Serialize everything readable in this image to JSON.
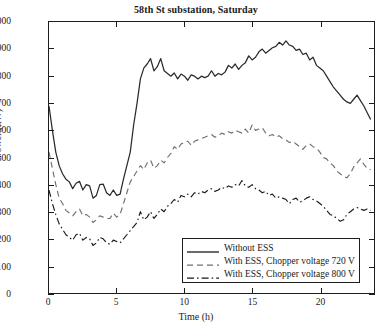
{
  "chart_data": {
    "type": "line",
    "title": "58th St substation, Saturday",
    "xlabel": "Time (h)",
    "ylabel": "Power (kW)",
    "xlim": [
      0,
      24
    ],
    "ylim": [
      0,
      1000
    ],
    "xticks": [
      0,
      5,
      10,
      15,
      20
    ],
    "ytick_labels": [
      "0",
      "100",
      "200",
      "300",
      "400",
      "500",
      "600",
      "700",
      "800",
      "900",
      "1000"
    ],
    "yticks": [
      0,
      100,
      200,
      300,
      400,
      500,
      600,
      700,
      800,
      900,
      1000
    ],
    "grid": false,
    "legend_position": "lower right",
    "series": [
      {
        "name": "Without ESS",
        "style": "solid",
        "color": "#2a2a2a",
        "x": [
          0,
          0.25,
          0.5,
          0.75,
          1,
          1.25,
          1.5,
          1.75,
          2,
          2.25,
          2.5,
          2.75,
          3,
          3.25,
          3.5,
          3.75,
          4,
          4.25,
          4.5,
          4.75,
          5,
          5.25,
          5.5,
          5.75,
          6,
          6.25,
          6.5,
          6.75,
          7,
          7.25,
          7.5,
          7.75,
          8,
          8.25,
          8.5,
          8.75,
          9,
          9.25,
          9.5,
          9.75,
          10,
          10.25,
          10.5,
          10.75,
          11,
          11.25,
          11.5,
          11.75,
          12,
          12.25,
          12.5,
          12.75,
          13,
          13.25,
          13.5,
          13.75,
          14,
          14.25,
          14.5,
          14.75,
          15,
          15.25,
          15.5,
          15.75,
          16,
          16.25,
          16.5,
          16.75,
          17,
          17.25,
          17.5,
          17.75,
          18,
          18.25,
          18.5,
          18.75,
          19,
          19.25,
          19.5,
          19.75,
          20,
          20.25,
          20.5,
          20.75,
          21,
          21.25,
          21.5,
          21.75,
          22,
          22.25,
          22.5,
          22.75,
          23,
          23.25,
          23.5,
          23.75
        ],
        "y": [
          690,
          600,
          520,
          470,
          440,
          420,
          410,
          385,
          405,
          412,
          380,
          400,
          395,
          350,
          360,
          400,
          402,
          370,
          360,
          380,
          360,
          365,
          420,
          470,
          520,
          620,
          700,
          790,
          830,
          845,
          865,
          820,
          835,
          865,
          820,
          810,
          800,
          812,
          790,
          808,
          800,
          785,
          805,
          800,
          790,
          800,
          795,
          800,
          820,
          800,
          810,
          805,
          815,
          840,
          830,
          845,
          825,
          840,
          850,
          875,
          860,
          870,
          890,
          900,
          885,
          895,
          905,
          910,
          925,
          915,
          930,
          915,
          910,
          895,
          900,
          880,
          885,
          860,
          870,
          840,
          830,
          820,
          800,
          780,
          760,
          745,
          730,
          715,
          705,
          700,
          715,
          730,
          710,
          690,
          665,
          640
        ]
      },
      {
        "name": "With ESS, Chopper voltage 720 V",
        "style": "dashed",
        "color": "#6f6f6f",
        "x": [
          0,
          0.25,
          0.5,
          0.75,
          1,
          1.25,
          1.5,
          1.75,
          2,
          2.25,
          2.5,
          2.75,
          3,
          3.25,
          3.5,
          3.75,
          4,
          4.25,
          4.5,
          4.75,
          5,
          5.25,
          5.5,
          5.75,
          6,
          6.25,
          6.5,
          6.75,
          7,
          7.25,
          7.5,
          7.75,
          8,
          8.25,
          8.5,
          8.75,
          9,
          9.25,
          9.5,
          9.75,
          10,
          10.25,
          10.5,
          10.75,
          11,
          11.25,
          11.5,
          11.75,
          12,
          12.25,
          12.5,
          12.75,
          13,
          13.25,
          13.5,
          13.75,
          14,
          14.25,
          14.5,
          14.75,
          15,
          15.25,
          15.5,
          15.75,
          16,
          16.25,
          16.5,
          16.75,
          17,
          17.25,
          17.5,
          17.75,
          18,
          18.25,
          18.5,
          18.75,
          19,
          19.25,
          19.5,
          19.75,
          20,
          20.25,
          20.5,
          20.75,
          21,
          21.25,
          21.5,
          21.75,
          22,
          22.25,
          22.5,
          22.75,
          23,
          23.25,
          23.5,
          23.75
        ],
        "y": [
          520,
          460,
          400,
          350,
          330,
          305,
          295,
          285,
          300,
          310,
          285,
          290,
          280,
          260,
          270,
          285,
          280,
          275,
          275,
          295,
          280,
          290,
          330,
          370,
          410,
          430,
          450,
          470,
          455,
          480,
          490,
          460,
          470,
          490,
          480,
          500,
          515,
          540,
          530,
          550,
          555,
          560,
          545,
          560,
          565,
          570,
          575,
          580,
          585,
          575,
          580,
          590,
          585,
          595,
          590,
          600,
          595,
          590,
          605,
          590,
          620,
          600,
          605,
          610,
          590,
          580,
          585,
          575,
          580,
          570,
          565,
          555,
          560,
          550,
          540,
          530,
          545,
          550,
          540,
          535,
          520,
          500,
          495,
          480,
          470,
          450,
          440,
          430,
          425,
          440,
          465,
          480,
          495,
          475,
          460,
          455
        ]
      },
      {
        "name": "With ESS, Chopper voltage 800 V",
        "style": "dashdot",
        "color": "#1a1a1a",
        "x": [
          0,
          0.25,
          0.5,
          0.75,
          1,
          1.25,
          1.5,
          1.75,
          2,
          2.25,
          2.5,
          2.75,
          3,
          3.25,
          3.5,
          3.75,
          4,
          4.25,
          4.5,
          4.75,
          5,
          5.25,
          5.5,
          5.75,
          6,
          6.25,
          6.5,
          6.75,
          7,
          7.25,
          7.5,
          7.75,
          8,
          8.25,
          8.5,
          8.75,
          9,
          9.25,
          9.5,
          9.75,
          10,
          10.25,
          10.5,
          10.75,
          11,
          11.25,
          11.5,
          11.75,
          12,
          12.25,
          12.5,
          12.75,
          13,
          13.25,
          13.5,
          13.75,
          14,
          14.25,
          14.5,
          14.75,
          15,
          15.25,
          15.5,
          15.75,
          16,
          16.25,
          16.5,
          16.75,
          17,
          17.25,
          17.5,
          17.75,
          18,
          18.25,
          18.5,
          18.75,
          19,
          19.25,
          19.5,
          19.75,
          20,
          20.25,
          20.5,
          20.75,
          21,
          21.25,
          21.5,
          21.75,
          22,
          22.25,
          22.5,
          22.75,
          23,
          23.25,
          23.5,
          23.75
        ],
        "y": [
          380,
          330,
          290,
          255,
          235,
          215,
          205,
          195,
          215,
          220,
          195,
          205,
          200,
          175,
          185,
          205,
          200,
          185,
          180,
          195,
          190,
          185,
          200,
          215,
          230,
          245,
          260,
          300,
          270,
          280,
          300,
          275,
          290,
          310,
          300,
          320,
          330,
          345,
          335,
          360,
          355,
          365,
          355,
          370,
          365,
          375,
          370,
          380,
          385,
          375,
          380,
          390,
          385,
          395,
          390,
          400,
          395,
          415,
          395,
          390,
          400,
          385,
          380,
          370,
          375,
          360,
          365,
          350,
          355,
          350,
          345,
          330,
          345,
          350,
          335,
          340,
          350,
          355,
          345,
          340,
          330,
          320,
          305,
          290,
          285,
          275,
          265,
          270,
          290,
          300,
          310,
          315,
          310,
          305,
          310,
          305
        ]
      }
    ]
  },
  "legend": {
    "items": [
      {
        "label": "Without ESS"
      },
      {
        "label": "With ESS, Chopper voltage 720 V"
      },
      {
        "label": "With ESS, Chopper voltage 800 V"
      }
    ]
  }
}
